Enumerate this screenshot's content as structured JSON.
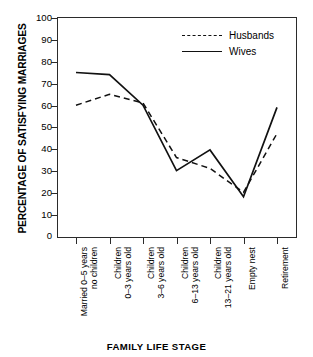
{
  "title": "",
  "axis": {
    "ylabel": "PERCENTAGE OF SATISFYING MARRIAGES",
    "xlabel": "FAMILY LIFE STAGE"
  },
  "legend": {
    "items": [
      {
        "label": "Husbands",
        "style": "dashed",
        "color": "#111111"
      },
      {
        "label": "Wives",
        "style": "solid",
        "color": "#111111"
      }
    ]
  },
  "yticks": [
    "0",
    "10",
    "20",
    "30",
    "40",
    "50",
    "60",
    "70",
    "80",
    "90",
    "100"
  ],
  "xticks": [
    {
      "line1": "Married 0–5 years",
      "line2": "no children"
    },
    {
      "line1": "Children",
      "line2": "0–3 years old"
    },
    {
      "line1": "Children",
      "line2": "3–6 years old"
    },
    {
      "line1": "Children",
      "line2": "6–13 years old"
    },
    {
      "line1": "Children",
      "line2": "13–21 years old"
    },
    {
      "line1": "Empty nest",
      "line2": ""
    },
    {
      "line1": "Retirement",
      "line2": ""
    }
  ],
  "chart_data": {
    "type": "line",
    "title": "",
    "xlabel": "FAMILY LIFE STAGE",
    "ylabel": "PERCENTAGE OF SATISFYING MARRIAGES",
    "ylim": [
      0,
      100
    ],
    "ytick_step": 10,
    "grid": false,
    "legend_position": "top-right",
    "categories": [
      "Married 0–5 years, no children",
      "Children 0–3 years old",
      "Children 3–6 years old",
      "Children 6–13 years old",
      "Children 13–21 years old",
      "Empty nest",
      "Retirement"
    ],
    "series": [
      {
        "name": "Husbands",
        "style": "dashed",
        "color": "#111111",
        "values": [
          60,
          65,
          61,
          36,
          31,
          20,
          47
        ]
      },
      {
        "name": "Wives",
        "style": "solid",
        "color": "#111111",
        "values": [
          75,
          74,
          60,
          30,
          39.5,
          18,
          59
        ]
      }
    ]
  }
}
